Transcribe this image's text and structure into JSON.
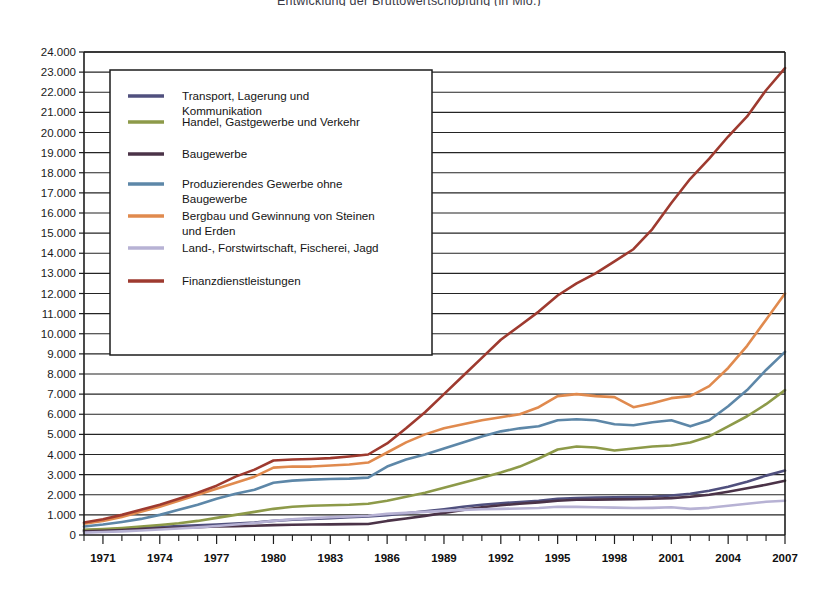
{
  "chart_data": {
    "type": "line",
    "title": "Entwicklung der Bruttowertschöpfung (in Mio.)",
    "xlabel": "",
    "ylabel": "",
    "grid": true,
    "legend_position": "upper-left-inside",
    "xlim": [
      1970,
      2007
    ],
    "ylim": [
      0,
      24000
    ],
    "ytick_step": 1000,
    "ytick_labels": [
      "0",
      "1.000",
      "2.000",
      "3.000",
      "4.000",
      "5.000",
      "6.000",
      "7.000",
      "8.000",
      "9.000",
      "10.000",
      "11.000",
      "12.000",
      "13.000",
      "14.000",
      "15.000",
      "16.000",
      "17.000",
      "18.000",
      "19.000",
      "20.000",
      "21.000",
      "22.000",
      "23.000",
      "24.000"
    ],
    "xtick_labels": [
      "1971",
      "1974",
      "1977",
      "1980",
      "1983",
      "1986",
      "1989",
      "1992",
      "1995",
      "1998",
      "2001",
      "2004",
      "2007"
    ],
    "xtick_values": [
      1971,
      1974,
      1977,
      1980,
      1983,
      1986,
      1989,
      1992,
      1995,
      1998,
      2001,
      2004,
      2007
    ],
    "x": [
      1970,
      1971,
      1972,
      1973,
      1974,
      1975,
      1976,
      1977,
      1978,
      1979,
      1980,
      1981,
      1982,
      1983,
      1984,
      1985,
      1986,
      1987,
      1988,
      1989,
      1990,
      1991,
      1992,
      1993,
      1994,
      1995,
      1996,
      1997,
      1998,
      1999,
      2000,
      2001,
      2002,
      2003,
      2004,
      2005,
      2006,
      2007
    ],
    "series": [
      {
        "name": "Transport, Lagerung und Kommunikation",
        "color": "#50507e",
        "values": [
          230,
          270,
          310,
          350,
          400,
          440,
          480,
          520,
          570,
          620,
          700,
          760,
          800,
          840,
          880,
          920,
          980,
          1080,
          1180,
          1280,
          1400,
          1500,
          1580,
          1640,
          1700,
          1800,
          1840,
          1860,
          1870,
          1880,
          1900,
          1960,
          2050,
          2200,
          2400,
          2650,
          2950,
          3200
        ]
      },
      {
        "name": "Handel, Gastgewerbe und Verkehr",
        "color": "#8d9a49",
        "values": [
          260,
          300,
          350,
          420,
          500,
          580,
          700,
          850,
          1000,
          1150,
          1300,
          1400,
          1450,
          1480,
          1500,
          1550,
          1700,
          1900,
          2100,
          2350,
          2600,
          2850,
          3100,
          3400,
          3800,
          4250,
          4400,
          4350,
          4200,
          4300,
          4400,
          4450,
          4600,
          4900,
          5400,
          5900,
          6500,
          7200
        ]
      },
      {
        "name": "Baugewerbe",
        "color": "#4b3348",
        "values": [
          180,
          210,
          250,
          290,
          330,
          360,
          390,
          420,
          440,
          460,
          490,
          510,
          520,
          530,
          540,
          550,
          700,
          820,
          950,
          1100,
          1250,
          1380,
          1480,
          1550,
          1620,
          1700,
          1750,
          1760,
          1770,
          1780,
          1800,
          1830,
          1900,
          2000,
          2150,
          2320,
          2500,
          2700
        ]
      },
      {
        "name": "Produzierendes Gewerbe ohne Baugewerbe",
        "color": "#5d87a8",
        "values": [
          420,
          520,
          650,
          800,
          1000,
          1250,
          1500,
          1800,
          2050,
          2250,
          2600,
          2700,
          2750,
          2780,
          2800,
          2850,
          3400,
          3750,
          4000,
          4300,
          4600,
          4900,
          5150,
          5300,
          5400,
          5700,
          5750,
          5700,
          5500,
          5450,
          5600,
          5700,
          5400,
          5700,
          6400,
          7200,
          8200,
          9100
        ]
      },
      {
        "name": "Bergbau und Gewinnung von Steinen und Erden",
        "color": "#e08a4e",
        "values": [
          560,
          700,
          900,
          1150,
          1400,
          1700,
          2000,
          2300,
          2600,
          2900,
          3350,
          3400,
          3400,
          3450,
          3500,
          3600,
          4100,
          4600,
          5000,
          5300,
          5500,
          5700,
          5850,
          6000,
          6350,
          6900,
          7000,
          6900,
          6850,
          6350,
          6550,
          6800,
          6900,
          7400,
          8300,
          9400,
          10700,
          12000
        ]
      },
      {
        "name": "Land-, Forstwirtschaft, Fischerei, Jagd",
        "color": "#b7b2d4",
        "values": [
          120,
          150,
          180,
          220,
          270,
          320,
          380,
          450,
          520,
          600,
          700,
          780,
          840,
          880,
          920,
          960,
          1050,
          1100,
          1150,
          1200,
          1250,
          1280,
          1300,
          1320,
          1340,
          1400,
          1400,
          1380,
          1360,
          1340,
          1350,
          1380,
          1300,
          1350,
          1450,
          1550,
          1650,
          1700
        ]
      },
      {
        "name": "Finanzdienstleistungen",
        "color": "#9e3a2f",
        "values": [
          620,
          780,
          1000,
          1250,
          1500,
          1800,
          2100,
          2450,
          2900,
          3250,
          3700,
          3750,
          3780,
          3820,
          3900,
          4000,
          4550,
          5300,
          6100,
          7000,
          7900,
          8800,
          9700,
          10400,
          11100,
          11900,
          12500,
          13000,
          13600,
          14200,
          15200,
          16500,
          17700,
          18700,
          19800,
          20800,
          22100,
          23200
        ]
      }
    ]
  }
}
